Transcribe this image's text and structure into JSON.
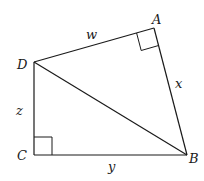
{
  "diagram": {
    "type": "geometry-quadrilateral",
    "stroke_color": "#1a1a1a",
    "background": "#ffffff",
    "vertices": {
      "A": {
        "label": "A",
        "x": 154,
        "y": 28
      },
      "B": {
        "label": "B",
        "x": 187,
        "y": 155
      },
      "C": {
        "label": "C",
        "x": 34,
        "y": 155
      },
      "D": {
        "label": "D",
        "x": 34,
        "y": 62
      }
    },
    "segments": [
      {
        "from": "D",
        "to": "A",
        "label": "w"
      },
      {
        "from": "A",
        "to": "B",
        "label": "x"
      },
      {
        "from": "C",
        "to": "B",
        "label": "y"
      },
      {
        "from": "D",
        "to": "C",
        "label": "z"
      },
      {
        "from": "D",
        "to": "B",
        "label": ""
      }
    ],
    "right_angles": [
      "A",
      "C"
    ],
    "side_labels": {
      "w": "w",
      "x": "x",
      "y": "y",
      "z": "z"
    }
  }
}
